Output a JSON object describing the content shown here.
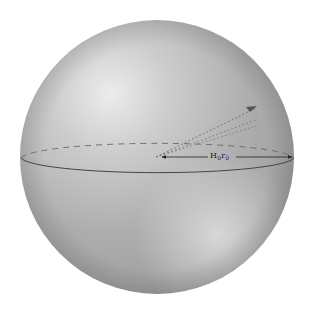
{
  "diagram": {
    "title": "",
    "sphere": {
      "center": [
        157,
        157
      ],
      "radius": 137,
      "base_color": "#a8a8a8",
      "highlight_color": "#e6e6e6",
      "shadow_color": "#8c8c8c"
    },
    "equator": {
      "style_back": "dashed",
      "style_front": "solid",
      "color": "#555555"
    },
    "arrow": {
      "label_main": "H",
      "label_sub1": "0",
      "label_mid": "r",
      "label_sub2": "0",
      "label_full": "H₀r₀",
      "color": "#222222"
    },
    "direction_vector": {
      "style": "dotted",
      "color": "#666666"
    }
  }
}
